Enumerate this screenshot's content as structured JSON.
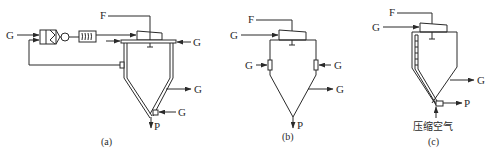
{
  "diagram": {
    "type": "process-flow",
    "panels": [
      {
        "id": "a",
        "caption": "(a)",
        "labels": {
          "feed": "F",
          "gas_in_left": "G",
          "gas_in_top_right": "G",
          "gas_out_side": "G",
          "gas_in_bottom": "G",
          "product": "P"
        },
        "components": [
          "filter",
          "fan",
          "heater",
          "atomizer",
          "chamber",
          "recycle-line"
        ]
      },
      {
        "id": "b",
        "caption": "(b)",
        "labels": {
          "feed": "F",
          "gas_in_top": "G",
          "gas_in_left": "G",
          "gas_in_right": "G",
          "gas_out": "G",
          "product": "P"
        },
        "components": [
          "atomizer",
          "chamber",
          "side-inlets"
        ]
      },
      {
        "id": "c",
        "caption": "(c)",
        "labels": {
          "feed": "F",
          "gas_in_top": "G",
          "gas_out": "G",
          "product": "P",
          "compressed_air": "压缩空气"
        },
        "components": [
          "atomizer",
          "chamber",
          "air-jacket-wall"
        ]
      }
    ],
    "colors": {
      "line": "#2a2a2a",
      "background": "#ffffff"
    }
  }
}
